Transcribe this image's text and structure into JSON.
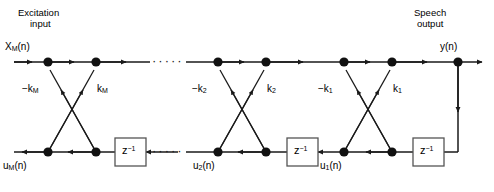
{
  "diagram": {
    "type": "lattice-filter-signal-flow-graph",
    "headers": {
      "left_line1": "Excitation",
      "left_line2": "input",
      "right_line1": "Speech",
      "right_line2": "output"
    },
    "signals": {
      "input": "X",
      "input_sub": "M",
      "input_arg": "(n)",
      "output": "y(n)",
      "bottom_left": "u",
      "bottom_left_sub": "M",
      "bottom_left_arg": "(n)",
      "bottom_mid": "u",
      "bottom_mid_sub": "2",
      "bottom_mid_arg": "(n)",
      "bottom_right": "u",
      "bottom_right_sub": "1",
      "bottom_right_arg": "(n)"
    },
    "coefficients": [
      {
        "neg_label": "−k",
        "neg_sub": "M",
        "pos_label": "k",
        "pos_sub": "M"
      },
      {
        "neg_label": "−k",
        "neg_sub": "2",
        "pos_label": "k",
        "pos_sub": "2"
      },
      {
        "neg_label": "−k",
        "neg_sub": "1",
        "pos_label": "k",
        "pos_sub": "1"
      }
    ],
    "delay_label": "z",
    "delay_exponent": "−1",
    "delay_count": 3,
    "ellipsis": "·····",
    "colors": {
      "line": "#1a1a1a",
      "node": "#111111",
      "box_border": "#555555",
      "background": "#ffffff"
    }
  }
}
